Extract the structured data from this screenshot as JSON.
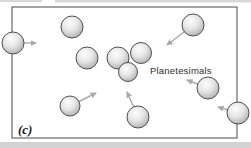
{
  "figure": {
    "panel_label": "(c)",
    "annotation": "Planetesimals",
    "colors": {
      "background": "#ffffff",
      "frame_border": "#4a4a4a",
      "sphere_highlight": "#fdfdfd",
      "sphere_mid": "#e6e6e6",
      "sphere_edge": "#a8a8a8",
      "sphere_outline": "#4f4f4f",
      "arrow": "#a9a9a9",
      "annotation_color": "#2e2e2e",
      "panel_label_color": "#1a1a1a",
      "scan_band": "#d2d2d2"
    },
    "frame": {
      "x": 12,
      "y": 7,
      "width": 225,
      "height": 131
    },
    "spheres": [
      {
        "cx": 13,
        "cy": 43,
        "r": 11,
        "arrow": {
          "tx": 36,
          "ty": 43
        }
      },
      {
        "cx": 72,
        "cy": 27,
        "r": 11
      },
      {
        "cx": 87,
        "cy": 58,
        "r": 11
      },
      {
        "cx": 118,
        "cy": 58,
        "r": 11
      },
      {
        "cx": 141,
        "cy": 53,
        "r": 10.5
      },
      {
        "cx": 128,
        "cy": 72,
        "r": 9.5
      },
      {
        "cx": 193,
        "cy": 25,
        "r": 11,
        "arrow": {
          "tx": 167,
          "ty": 45
        }
      },
      {
        "cx": 70,
        "cy": 106,
        "r": 10,
        "arrow": {
          "tx": 96,
          "ty": 93
        }
      },
      {
        "cx": 138,
        "cy": 117,
        "r": 11,
        "arrow": {
          "tx": 127,
          "ty": 92
        }
      },
      {
        "cx": 208,
        "cy": 88,
        "r": 11,
        "arrow": {
          "tx": 187,
          "ty": 80
        }
      },
      {
        "cx": 238,
        "cy": 113,
        "r": 11,
        "arrow": {
          "tx": 218,
          "ty": 107
        }
      }
    ]
  }
}
